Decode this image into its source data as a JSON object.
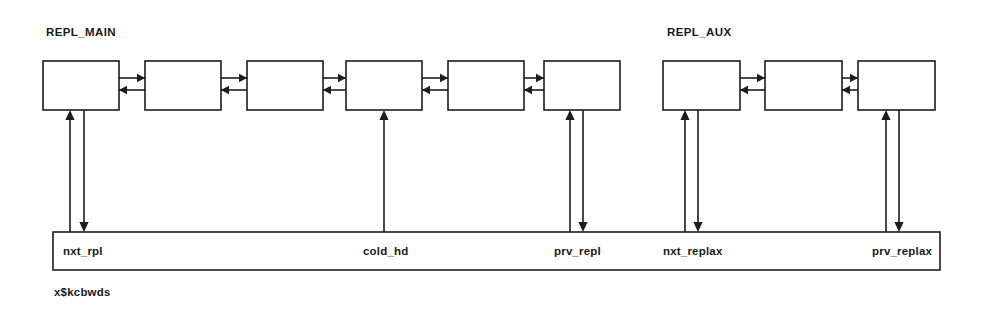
{
  "diagram": {
    "title_main": "REPL_MAIN",
    "title_aux": "REPL_AUX",
    "structure_label": "x$kcbwds",
    "colors": {
      "stroke": "#1c1c1c",
      "fill": "#ffffff",
      "text": "#1a1a1a",
      "background": "#ffffff"
    },
    "groups": [
      {
        "name": "REPL_MAIN",
        "title": "REPL_MAIN",
        "title_x": 46,
        "title_y": 36,
        "node_count": 6,
        "nodes": [
          {
            "id": "main-node-1",
            "x": 43,
            "y": 61,
            "w": 76,
            "h": 49
          },
          {
            "id": "main-node-2",
            "x": 145,
            "y": 61,
            "w": 76,
            "h": 49
          },
          {
            "id": "main-node-3",
            "x": 247,
            "y": 61,
            "w": 76,
            "h": 49
          },
          {
            "id": "main-node-4",
            "x": 346,
            "y": 61,
            "w": 76,
            "h": 49
          },
          {
            "id": "main-node-5",
            "x": 448,
            "y": 61,
            "w": 76,
            "h": 49
          },
          {
            "id": "main-node-6",
            "x": 544,
            "y": 61,
            "w": 76,
            "h": 49
          }
        ]
      },
      {
        "name": "REPL_AUX",
        "title": "REPL_AUX",
        "title_x": 667,
        "title_y": 36,
        "node_count": 3,
        "nodes": [
          {
            "id": "aux-node-1",
            "x": 663,
            "y": 61,
            "w": 77,
            "h": 49
          },
          {
            "id": "aux-node-2",
            "x": 765,
            "y": 61,
            "w": 77,
            "h": 49
          },
          {
            "id": "aux-node-3",
            "x": 858,
            "y": 61,
            "w": 77,
            "h": 49
          }
        ]
      }
    ],
    "peer_links": [
      {
        "id": "link-main-1-2",
        "x1": 119,
        "x2": 145,
        "y_right": 78,
        "y_left": 90
      },
      {
        "id": "link-main-2-3",
        "x1": 221,
        "x2": 247,
        "y_right": 78,
        "y_left": 90
      },
      {
        "id": "link-main-3-4",
        "x1": 323,
        "x2": 346,
        "y_right": 78,
        "y_left": 90
      },
      {
        "id": "link-main-4-5",
        "x1": 422,
        "x2": 448,
        "y_right": 78,
        "y_left": 90
      },
      {
        "id": "link-main-5-6",
        "x1": 524,
        "x2": 544,
        "y_right": 78,
        "y_left": 90
      },
      {
        "id": "link-aux-1-2",
        "x1": 740,
        "x2": 765,
        "y_right": 78,
        "y_left": 90
      },
      {
        "id": "link-aux-2-3",
        "x1": 842,
        "x2": 858,
        "y_right": 78,
        "y_left": 90
      }
    ],
    "bar": {
      "x": 53,
      "y": 232,
      "w": 887,
      "h": 38
    },
    "pointers": [
      {
        "id": "pointer-nxt-rpl",
        "label": "nxt_rpl",
        "label_x": 63,
        "label_y": 255,
        "kind": "double",
        "up_x": 70,
        "down_x": 84,
        "top_y": 110,
        "bottom_y": 232
      },
      {
        "id": "pointer-cold-hd",
        "label": "cold_hd",
        "label_x": 363,
        "label_y": 255,
        "kind": "single-up",
        "up_x": 384,
        "down_x": null,
        "top_y": 110,
        "bottom_y": 232
      },
      {
        "id": "pointer-prv-repl",
        "label": "prv_repl",
        "label_x": 554,
        "label_y": 255,
        "kind": "double",
        "up_x": 570,
        "down_x": 583,
        "top_y": 110,
        "bottom_y": 232
      },
      {
        "id": "pointer-nxt-replax",
        "label": "nxt_replax",
        "label_x": 663,
        "label_y": 255,
        "kind": "double",
        "up_x": 685,
        "down_x": 698,
        "top_y": 110,
        "bottom_y": 232
      },
      {
        "id": "pointer-prv-replax",
        "label": "prv_replax",
        "label_x": 872,
        "label_y": 255,
        "kind": "double",
        "up_x": 886,
        "down_x": 899,
        "top_y": 110,
        "bottom_y": 232
      }
    ],
    "struct_label_pos": {
      "x": 54,
      "y": 296
    }
  }
}
